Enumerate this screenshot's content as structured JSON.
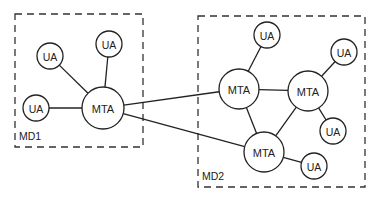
{
  "diagram": {
    "domains": [
      {
        "id": "md1",
        "label": "MD1"
      },
      {
        "id": "md2",
        "label": "MD2"
      }
    ],
    "nodes": [
      {
        "id": "md1-ua-1",
        "label": "UA",
        "type": "ua",
        "domain": "md1"
      },
      {
        "id": "md1-ua-2",
        "label": "UA",
        "type": "ua",
        "domain": "md1"
      },
      {
        "id": "md1-ua-3",
        "label": "UA",
        "type": "ua",
        "domain": "md1"
      },
      {
        "id": "md1-mta",
        "label": "MTA",
        "type": "mta",
        "domain": "md1"
      },
      {
        "id": "md2-ua-1",
        "label": "UA",
        "type": "ua",
        "domain": "md2"
      },
      {
        "id": "md2-ua-2",
        "label": "UA",
        "type": "ua",
        "domain": "md2"
      },
      {
        "id": "md2-mta-1",
        "label": "MTA",
        "type": "mta",
        "domain": "md2"
      },
      {
        "id": "md2-mta-2",
        "label": "MTA",
        "type": "mta",
        "domain": "md2"
      },
      {
        "id": "md2-ua-3",
        "label": "UA",
        "type": "ua",
        "domain": "md2"
      },
      {
        "id": "md2-mta-3",
        "label": "MTA",
        "type": "mta",
        "domain": "md2"
      },
      {
        "id": "md2-ua-4",
        "label": "UA",
        "type": "ua",
        "domain": "md2"
      }
    ],
    "edges": [
      [
        "md1-ua-1",
        "md1-mta"
      ],
      [
        "md1-ua-2",
        "md1-mta"
      ],
      [
        "md1-ua-3",
        "md1-mta"
      ],
      [
        "md1-mta",
        "md2-mta-1"
      ],
      [
        "md1-mta",
        "md2-mta-3"
      ],
      [
        "md2-ua-1",
        "md2-mta-1"
      ],
      [
        "md2-mta-1",
        "md2-mta-2"
      ],
      [
        "md2-mta-1",
        "md2-mta-3"
      ],
      [
        "md2-mta-2",
        "md2-ua-2"
      ],
      [
        "md2-mta-2",
        "md2-ua-3"
      ],
      [
        "md2-mta-2",
        "md2-mta-3"
      ],
      [
        "md2-mta-3",
        "md2-ua-4"
      ]
    ]
  }
}
